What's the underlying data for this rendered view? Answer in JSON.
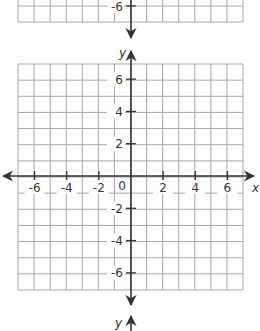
{
  "figure": {
    "colors": {
      "grid": "#a6a6a6",
      "axis": "#333333",
      "background": "#ffffff"
    }
  },
  "top_plane": {
    "visible_y_label": "-6",
    "y_axis_label": "y"
  },
  "main_plane": {
    "x_axis_label": "x",
    "y_axis_label": "y",
    "origin_label": "0",
    "x_range": [
      -7,
      7
    ],
    "y_range": [
      -7,
      7
    ],
    "grid_step": 1,
    "tick_step": 2,
    "x_tick_labels": [
      "-6",
      "-4",
      "-2",
      "2",
      "4",
      "6"
    ],
    "y_tick_labels": [
      "6",
      "4",
      "2",
      "-2",
      "-4",
      "-6"
    ]
  },
  "bottom_plane": {
    "y_axis_label": "y"
  }
}
